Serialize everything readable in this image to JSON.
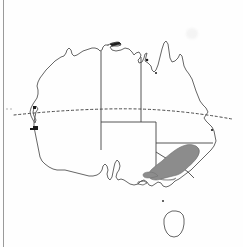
{
  "figure": {
    "title": "Distribution map of Australia",
    "subject": "Australia",
    "map_type": "species distribution / range map",
    "width_px": 243,
    "height_px": 247,
    "background_color": "#fefefe",
    "has_border": false,
    "labels_present": false,
    "text_present": false
  },
  "colors": {
    "coastline": "#555555",
    "state_border": "#444444",
    "tropic_line": "#4a4a4a",
    "range_shading_fill": "#8c8c8c",
    "range_shading_stroke": "#6f6f6f",
    "city_marker": "#1a1a1a",
    "page_edge": "#9a9a9a",
    "background": "#fefefe"
  },
  "legend": {
    "visible": false,
    "entries": [
      {
        "swatch_color": "#8c8c8c",
        "label": "shaded distribution range"
      }
    ]
  },
  "map_features": {
    "coastline": {
      "name": "Australian mainland coastline",
      "style": "thin solid outline",
      "visible": true
    },
    "state_borders": {
      "name": "internal state and territory borders",
      "style": "thin straight solid lines",
      "visible": true,
      "count": 5
    },
    "tropic_of_capricorn": {
      "name": "Tropic of Capricorn",
      "style": "dotted horizontal line extending past both coasts",
      "visible": true,
      "approx_latitude": "23.5 S"
    },
    "tasmania": {
      "name": "Tasmania",
      "style": "separate small island outline below mainland",
      "visible": true
    },
    "distribution_shading": {
      "name": "shaded distribution area",
      "region": "south-eastern Australia (Victorian Alps / Snowy Mountains, Victoria-New South Wales border)",
      "shape": "elongated teardrop / comma running north-east to south-west",
      "fill": "#8c8c8c",
      "visible": true
    },
    "city_markers": {
      "name": "small dark coastal marks",
      "visible": true,
      "count": 4,
      "note": "small ink dots along western and northern coasts"
    }
  },
  "states_depicted": [
    {
      "name": "Western Australia"
    },
    {
      "name": "Northern Territory"
    },
    {
      "name": "South Australia"
    },
    {
      "name": "Queensland"
    },
    {
      "name": "New South Wales"
    },
    {
      "name": "Victoria"
    },
    {
      "name": "Tasmania"
    }
  ],
  "artifacts": {
    "page_edge_line": "vertical dark scan line near left margin",
    "smudge": "faint gray smudge in upper right area"
  }
}
